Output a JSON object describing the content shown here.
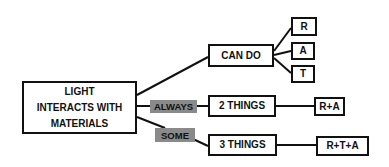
{
  "diagram": {
    "root": {
      "label": "LIGHT\nINTERACTS WITH\nMATERIALS",
      "lines": [
        "LIGHT",
        "INTERACTS WITH",
        "MATERIALS"
      ]
    },
    "branches": [
      {
        "edge_label": "",
        "node": "CAN DO",
        "children": [
          "R",
          "A",
          "T"
        ]
      },
      {
        "edge_label": "ALWAYS",
        "node": "2 THINGS",
        "children": [
          "R+A"
        ]
      },
      {
        "edge_label": "SOME",
        "node": "3 THINGS",
        "children": [
          "R+T+A"
        ]
      }
    ],
    "colors": {
      "border": "#111111",
      "edge_label_bg": "#8a8a8a",
      "background": "#ffffff"
    }
  }
}
